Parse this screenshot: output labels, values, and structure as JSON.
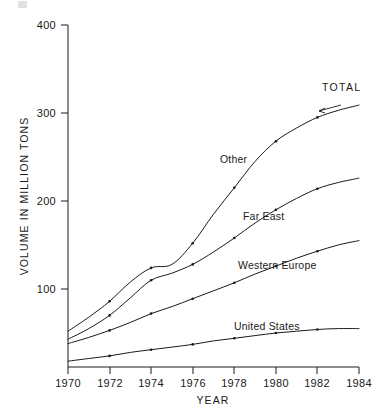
{
  "chart_data": {
    "type": "line",
    "title": "",
    "xlabel": "YEAR",
    "ylabel": "VOLUME IN MILLION TONS",
    "xlim": [
      1970,
      1984
    ],
    "ylim": [
      0,
      400
    ],
    "xticks": [
      "1970",
      "1972",
      "1974",
      "1976",
      "1978",
      "1980",
      "1982",
      "1984"
    ],
    "yticks": [
      "100",
      "200",
      "300",
      "400"
    ],
    "grid": false,
    "legend_position": "inline-labels",
    "x": [
      1970,
      1971,
      1972,
      1973,
      1974,
      1975,
      1976,
      1977,
      1978,
      1979,
      1980,
      1981,
      1982,
      1983,
      1984
    ],
    "series": [
      {
        "name": "TOTAL",
        "label": "TOTAL",
        "annotation": "arrow-pointing-to-total-curve",
        "values": [
          52,
          68,
          86,
          108,
          124,
          128,
          152,
          185,
          215,
          245,
          268,
          283,
          295,
          303,
          309
        ]
      },
      {
        "name": "Other",
        "label": "Other",
        "values": [
          43,
          55,
          70,
          90,
          110,
          118,
          128,
          142,
          158,
          175,
          190,
          203,
          214,
          221,
          226
        ]
      },
      {
        "name": "Far East",
        "label": "Far East",
        "values": [
          38,
          45,
          53,
          62,
          72,
          80,
          89,
          98,
          107,
          117,
          126,
          135,
          143,
          150,
          155
        ]
      },
      {
        "name": "United States",
        "label": "United States",
        "values": [
          18,
          21,
          24,
          28,
          31,
          34,
          37,
          41,
          44,
          47,
          50,
          52,
          54,
          55,
          55
        ]
      }
    ]
  },
  "axes": {
    "y_title": "VOLUME IN MILLION TONS",
    "x_title": "YEAR",
    "y_ticks": [
      {
        "label": "400"
      },
      {
        "label": "300"
      },
      {
        "label": "200"
      },
      {
        "label": "100"
      }
    ],
    "x_ticks": [
      {
        "label": "1970"
      },
      {
        "label": "1972"
      },
      {
        "label": "1974"
      },
      {
        "label": "1976"
      },
      {
        "label": "1978"
      },
      {
        "label": "1980"
      },
      {
        "label": "1982"
      },
      {
        "label": "1984"
      }
    ]
  },
  "series_labels": {
    "total": "TOTAL",
    "other": "Other",
    "far_east": "Far East",
    "united_states": "United States"
  },
  "colors": {
    "ink": "#1a1a1a",
    "background": "#ffffff"
  }
}
